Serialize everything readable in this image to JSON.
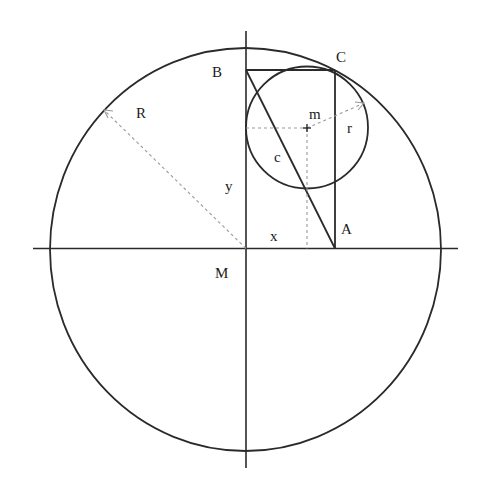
{
  "diagram": {
    "type": "geometry",
    "labels": {
      "B": "B",
      "C": "C",
      "A": "A",
      "M": "M",
      "m": "m",
      "R": "R",
      "r": "r",
      "c": "c",
      "x": "x",
      "y": "y"
    },
    "colors": {
      "line": "#2a2a2a",
      "dashed": "#9a9a9a",
      "background": "#ffffff"
    }
  }
}
